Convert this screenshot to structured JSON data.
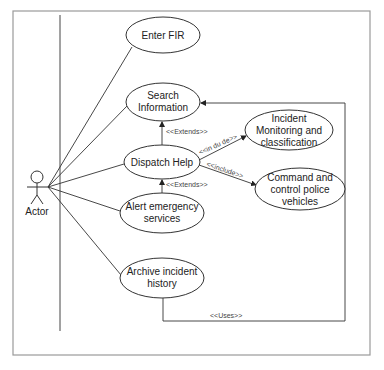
{
  "diagram": {
    "type": "use-case",
    "frame": {
      "x": 13,
      "y": 11,
      "w": 357,
      "h": 344,
      "stroke": "#9a9a9a"
    },
    "system_boundary_line": {
      "x": 60,
      "y1": 15,
      "y2": 331
    },
    "actor": {
      "label": "Actor",
      "x": 37,
      "y": 177
    },
    "use_cases": [
      {
        "id": "enter_fir",
        "lines": [
          "Enter FIR"
        ],
        "cx": 163,
        "cy": 35,
        "rx": 37,
        "ry": 18
      },
      {
        "id": "search_information",
        "lines": [
          "Search",
          "Information"
        ],
        "cx": 163,
        "cy": 102,
        "rx": 37,
        "ry": 19
      },
      {
        "id": "dispatch_help",
        "lines": [
          "Dispatch Help"
        ],
        "cx": 162,
        "cy": 162,
        "rx": 38,
        "ry": 17
      },
      {
        "id": "alert_emergency",
        "lines": [
          "Alert emergency",
          "services"
        ],
        "cx": 162,
        "cy": 213,
        "rx": 42,
        "ry": 20
      },
      {
        "id": "archive_incident",
        "lines": [
          "Archive incident",
          "history"
        ],
        "cx": 162,
        "cy": 278,
        "rx": 42,
        "ry": 20
      },
      {
        "id": "incident_monitoring",
        "lines": [
          "Incident",
          "Monitoring and",
          "classification"
        ],
        "cx": 289,
        "cy": 130,
        "rx": 44,
        "ry": 20
      },
      {
        "id": "command_control",
        "lines": [
          "Command and",
          "control police",
          "vehicles"
        ],
        "cx": 300,
        "cy": 189,
        "rx": 45,
        "ry": 21
      }
    ],
    "relationships": [
      {
        "label": "<<Extends>>",
        "from": "dispatch_help",
        "to": "search_information",
        "label_x": 166,
        "label_y": 134
      },
      {
        "label": "<<Extends>>",
        "from": "alert_emergency",
        "to": "dispatch_help",
        "label_x": 166,
        "label_y": 187
      },
      {
        "label": "<<in du de>>",
        "from": "dispatch_help",
        "to": "incident_monitoring",
        "label_x": 200,
        "label_y": 155,
        "rotate": -22
      },
      {
        "label": "<<include>>",
        "from": "dispatch_help",
        "to": "command_control",
        "label_x": 206,
        "label_y": 166,
        "rotate": 17
      },
      {
        "label": "<<Uses>>",
        "from": "archive_incident",
        "to": "search_information",
        "label_x": 210,
        "label_y": 318
      }
    ],
    "colors": {
      "stroke": "#333333",
      "frame": "#9a9a9a",
      "text": "#222222",
      "background": "#ffffff"
    }
  }
}
